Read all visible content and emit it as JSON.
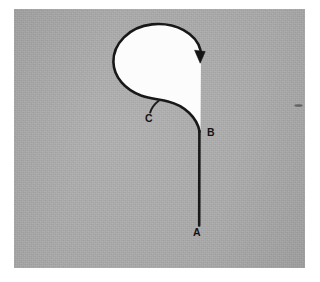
{
  "figure": {
    "background_color": "#a9a9a9",
    "paper_color": "#ffffff",
    "ink_color": "#181818",
    "interior_fill_color": "#fcfcfc"
  },
  "labels": [
    {
      "id": "label-a",
      "text": "A",
      "x": 197,
      "y": 236,
      "role": "start-point"
    },
    {
      "id": "label-b",
      "text": "B",
      "x": 211,
      "y": 136,
      "role": "junction-point"
    },
    {
      "id": "label-c",
      "text": "C",
      "x": 149,
      "y": 122,
      "role": "curve-point"
    }
  ],
  "markers": {
    "arrowhead": {
      "x": 200,
      "y": 57,
      "direction": "down",
      "meaning": "direction-of-travel"
    }
  },
  "geometry": {
    "segment_ab": {
      "from": [
        199,
        225
      ],
      "to": [
        199,
        131
      ],
      "type": "straight-line"
    },
    "loop": {
      "type": "closed-loop",
      "leftmost": [
        113,
        62
      ],
      "topmost": [
        152,
        24
      ],
      "rightmost": [
        201,
        55
      ],
      "crossing_near": [
        199,
        131
      ]
    },
    "leader_c": {
      "from": [
        158,
        101
      ],
      "to": [
        150,
        112
      ]
    }
  }
}
